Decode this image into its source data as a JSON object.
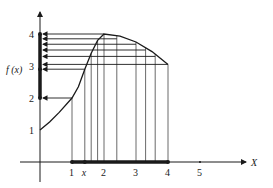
{
  "diagram": {
    "axes": {
      "x_label": "X",
      "y_label": "f (x)",
      "x_ticks": [
        {
          "value": 1,
          "label": "1"
        },
        {
          "value": 2,
          "label": "2"
        },
        {
          "value": 3,
          "label": "3"
        },
        {
          "value": 4,
          "label": "4"
        },
        {
          "value": 5,
          "label": "5"
        }
      ],
      "x_var_marker": {
        "value": 1.4,
        "label": "x"
      },
      "y_ticks": [
        {
          "value": 1,
          "label": "1"
        },
        {
          "value": 2,
          "label": "2"
        },
        {
          "value": 3,
          "label": "3"
        },
        {
          "value": 4,
          "label": "4"
        }
      ],
      "y_func_label_value": 2.9
    },
    "curve_points": [
      [
        0,
        1
      ],
      [
        0.3,
        1.25
      ],
      [
        0.6,
        1.55
      ],
      [
        1,
        2
      ],
      [
        1.2,
        2.35
      ],
      [
        1.4,
        2.9
      ],
      [
        1.6,
        3.4
      ],
      [
        1.8,
        3.8
      ],
      [
        2,
        4
      ],
      [
        2.5,
        3.93
      ],
      [
        3,
        3.75
      ],
      [
        3.5,
        3.45
      ],
      [
        4,
        3.05
      ]
    ],
    "domain_interval": [
      1,
      4
    ],
    "range_interval": [
      2,
      4
    ],
    "vertical_lines_x": [
      1,
      1.4,
      1.6,
      1.8,
      2,
      2.4,
      3,
      3.3,
      3.6,
      4
    ],
    "horizontal_arrows": [
      {
        "from_x": 1,
        "y": 2
      },
      {
        "from_x": 1.4,
        "y": 2.9
      },
      {
        "from_x": 4,
        "y": 3.05
      },
      {
        "from_x": 3.6,
        "y": 3.3
      },
      {
        "from_x": 3.3,
        "y": 3.5
      },
      {
        "from_x": 3,
        "y": 3.68
      },
      {
        "from_x": 2.4,
        "y": 3.85
      },
      {
        "from_x": 2,
        "y": 4
      }
    ],
    "colors": {
      "ink": "#1a1a1a",
      "line": "#333333"
    }
  }
}
